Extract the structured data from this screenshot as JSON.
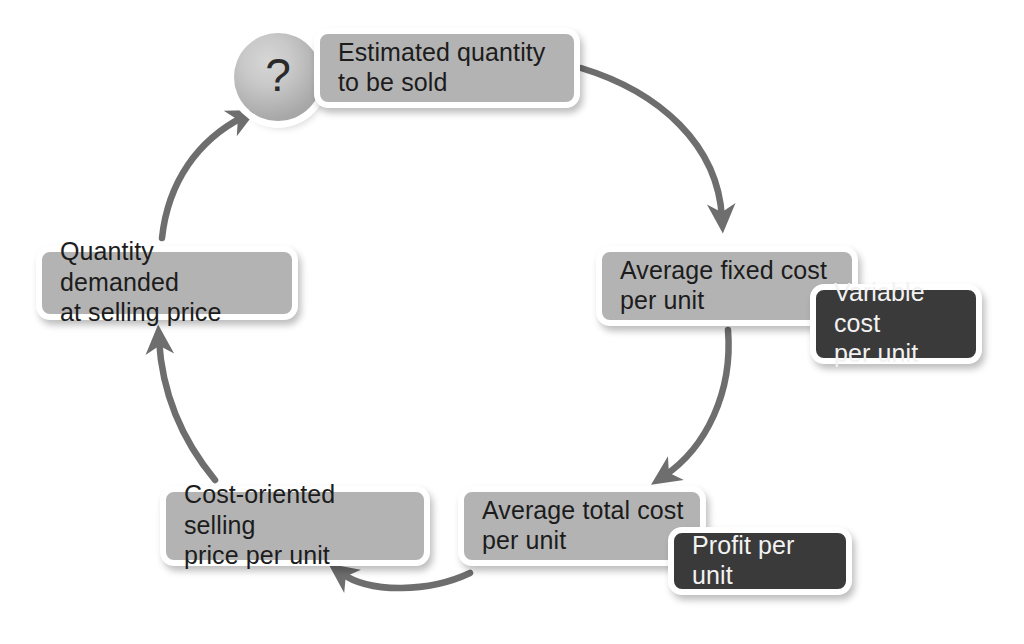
{
  "diagram": {
    "colors": {
      "light_node_fill": "#b3b3b3",
      "dark_node_fill": "#3a3a3a",
      "node_border": "#ffffff",
      "arrow": "#6e6e6e",
      "light_node_text": "#1c1c1c",
      "dark_node_text": "#f2f2f2",
      "background": "#ffffff"
    },
    "unknown_marker": {
      "symbol": "?",
      "name": "question-mark-sphere"
    },
    "nodes": [
      {
        "id": "estimated-quantity",
        "label": "Estimated quantity\nto be sold",
        "style": "light",
        "position": "top"
      },
      {
        "id": "avg-fixed-cost",
        "label": "Average fixed cost\nper unit",
        "style": "light",
        "position": "right-upper"
      },
      {
        "id": "variable-cost",
        "label": "Variable cost\nper unit",
        "style": "dark",
        "position": "right-upper-overlay"
      },
      {
        "id": "avg-total-cost",
        "label": "Average total cost\nper unit",
        "style": "light",
        "position": "bottom-right"
      },
      {
        "id": "profit-per-unit",
        "label": "Profit per unit",
        "style": "dark",
        "position": "bottom-right-overlay"
      },
      {
        "id": "cost-oriented-price",
        "label": "Cost-oriented selling\nprice per unit",
        "style": "light",
        "position": "bottom-left"
      },
      {
        "id": "quantity-demanded",
        "label": "Quantity demanded\nat selling price",
        "style": "light",
        "position": "left"
      }
    ],
    "arrows": [
      {
        "id": "arrow-estimated-to-fixed",
        "from": "estimated-quantity",
        "to": "avg-fixed-cost",
        "direction": "clockwise"
      },
      {
        "id": "arrow-fixed-to-total",
        "from": "avg-fixed-cost",
        "to": "avg-total-cost",
        "direction": "clockwise"
      },
      {
        "id": "arrow-total-to-cost-price",
        "from": "avg-total-cost",
        "to": "cost-oriented-price",
        "direction": "clockwise"
      },
      {
        "id": "arrow-cost-price-to-demand",
        "from": "cost-oriented-price",
        "to": "quantity-demanded",
        "direction": "clockwise"
      },
      {
        "id": "arrow-demand-to-unknown",
        "from": "quantity-demanded",
        "to": "question-mark-sphere",
        "direction": "clockwise"
      }
    ]
  }
}
